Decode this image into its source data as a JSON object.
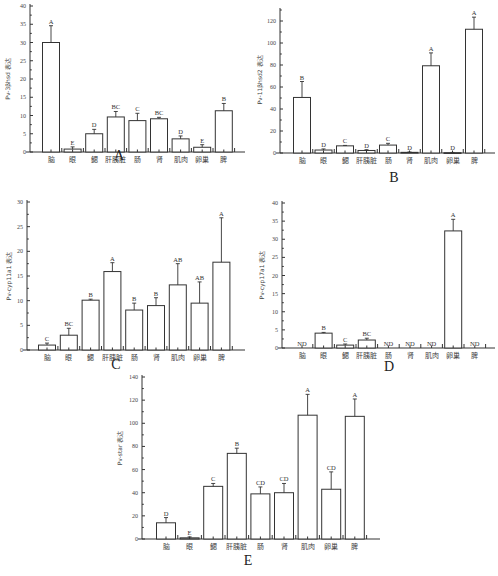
{
  "categories": [
    "脑",
    "眼",
    "鳃",
    "肝胰脏",
    "肠",
    "肾",
    "肌肉",
    "卵巢",
    "脾"
  ],
  "panels": {
    "A": {
      "label": "A",
      "ylabel": "Pv-3βhsd 表达"
    },
    "B": {
      "label": "B",
      "ylabel": "Pv-11βhsd2 表达"
    },
    "C": {
      "label": "C",
      "ylabel": "Pv-cyp11a1 表达"
    },
    "D": {
      "label": "D",
      "ylabel": "Pv-cyp17a1 表达"
    },
    "E": {
      "label": "E",
      "ylabel": "Pv-star 表达"
    }
  },
  "chart_data": [
    {
      "id": "A",
      "type": "bar",
      "title": "A",
      "xlabel": "",
      "ylabel": "Pv-3βhsd 表达",
      "ylim": [
        0,
        40
      ],
      "yticks": [
        0,
        5,
        10,
        15,
        20,
        25,
        30,
        35,
        40
      ],
      "categories": [
        "脑",
        "眼",
        "鳃",
        "肝胰脏",
        "肠",
        "肾",
        "肌肉",
        "卵巢",
        "脾"
      ],
      "values": [
        30.0,
        0.8,
        5.0,
        9.6,
        8.6,
        9.1,
        3.6,
        1.3,
        11.3
      ],
      "errors": [
        4.6,
        0.6,
        1.2,
        1.5,
        2.0,
        0.4,
        0.8,
        0.7,
        2.0
      ],
      "significance": [
        "A",
        "E",
        "D",
        "BC",
        "C",
        "BC",
        "D",
        "E",
        "B"
      ],
      "grid": false,
      "legend": null
    },
    {
      "id": "B",
      "type": "bar",
      "title": "B",
      "xlabel": "",
      "ylabel": "Pv-11βhsd2 表达",
      "ylim": [
        0,
        130
      ],
      "yticks": [
        0,
        20,
        40,
        60,
        80,
        100,
        120
      ],
      "categories": [
        "脑",
        "眼",
        "鳃",
        "肝胰脏",
        "肠",
        "肾",
        "肌肉",
        "卵巢",
        "脾"
      ],
      "values": [
        50.5,
        2.7,
        6.5,
        2.3,
        7.2,
        0.6,
        79.3,
        0.3,
        112.5
      ],
      "errors": [
        14.5,
        1.0,
        0.4,
        0.7,
        1.6,
        0.3,
        11.7,
        0.2,
        11.0
      ],
      "significance": [
        "B",
        "D",
        "C",
        "D",
        "C",
        "D",
        "A",
        "D",
        "A"
      ],
      "grid": false,
      "legend": null
    },
    {
      "id": "C",
      "type": "bar",
      "title": "C",
      "xlabel": "",
      "ylabel": "Pv-cyp11a1 表达",
      "ylim": [
        0,
        30
      ],
      "yticks": [
        0,
        5,
        10,
        15,
        20,
        25,
        30
      ],
      "categories": [
        "脑",
        "眼",
        "鳃",
        "肝胰脏",
        "肠",
        "肾",
        "肌肉",
        "卵巢",
        "脾"
      ],
      "values": [
        1.0,
        3.0,
        10.1,
        15.9,
        8.1,
        9.0,
        13.2,
        9.5,
        17.8
      ],
      "errors": [
        0.4,
        1.4,
        0.2,
        1.8,
        1.4,
        1.6,
        4.3,
        4.3,
        9.0
      ],
      "significance": [
        "C",
        "BC",
        "B",
        "A",
        "B",
        "B",
        "AB",
        "AB",
        "A"
      ],
      "grid": false,
      "legend": null
    },
    {
      "id": "D",
      "type": "bar",
      "title": "D",
      "xlabel": "",
      "ylabel": "Pv-cyp17a1 表达",
      "ylim": [
        0,
        40
      ],
      "yticks": [
        0,
        5,
        10,
        15,
        20,
        25,
        30,
        35,
        40
      ],
      "categories": [
        "脑",
        "眼",
        "鳃",
        "肝胰脏",
        "肠",
        "肾",
        "肌肉",
        "卵巢",
        "脾"
      ],
      "values": [
        0,
        4.1,
        0.8,
        2.2,
        0,
        0,
        0,
        32.3,
        0
      ],
      "errors": [
        0,
        0.2,
        0.3,
        0.5,
        0,
        0,
        0,
        3.2,
        0
      ],
      "significance": [
        "ND",
        "B",
        "C",
        "BC",
        "ND",
        "ND",
        "ND",
        "A",
        "ND"
      ],
      "grid": false,
      "legend": null
    },
    {
      "id": "E",
      "type": "bar",
      "title": "E",
      "xlabel": "",
      "ylabel": "Pv-star 表达",
      "ylim": [
        0,
        140
      ],
      "yticks": [
        0,
        20,
        40,
        60,
        80,
        100,
        120,
        140
      ],
      "categories": [
        "脑",
        "眼",
        "鳃",
        "肝胰脏",
        "肠",
        "肾",
        "肌肉",
        "卵巢",
        "脾"
      ],
      "values": [
        14.0,
        1.0,
        45.5,
        74.0,
        39.0,
        40.0,
        107.0,
        43.0,
        106.0
      ],
      "errors": [
        4.5,
        0.8,
        2.5,
        4.5,
        6.0,
        8.0,
        18.0,
        15.0,
        15.0
      ],
      "significance": [
        "D",
        "E",
        "C",
        "B",
        "CD",
        "CD",
        "A",
        "CD",
        "A"
      ],
      "grid": false,
      "legend": null
    }
  ]
}
